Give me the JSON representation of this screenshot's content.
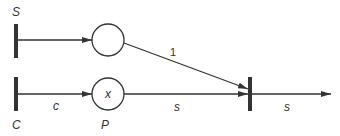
{
  "diagram": {
    "type": "petri-net",
    "colors": {
      "stroke": "#333333",
      "background": "#ffffff"
    },
    "transitions": [
      {
        "id": "S",
        "label": "S"
      },
      {
        "id": "C",
        "label": "C"
      },
      {
        "id": "T",
        "label": ""
      }
    ],
    "places": [
      {
        "id": "top",
        "label": "",
        "token": ""
      },
      {
        "id": "P",
        "label": "P",
        "token": "x"
      }
    ],
    "arcs": [
      {
        "from": "S",
        "to": "top",
        "label": ""
      },
      {
        "from": "C",
        "to": "P",
        "label": "c"
      },
      {
        "from": "top",
        "to": "T",
        "label": "1"
      },
      {
        "from": "P",
        "to": "T",
        "label": "s"
      },
      {
        "from": "T",
        "to": "out",
        "label": "s"
      }
    ]
  }
}
